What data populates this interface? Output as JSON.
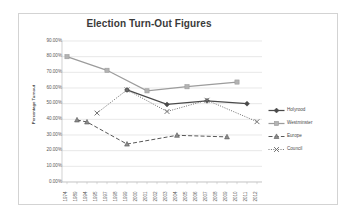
{
  "chart": {
    "title": "Election Turn-Out Figures",
    "y_axis_title": "Percentage Turnout",
    "legend_position": "right"
  },
  "chart_data": {
    "type": "line",
    "title": "Election Turn-Out Figures",
    "xlabel": "",
    "ylabel": "Percentage Turnout",
    "ylim": [
      0,
      90
    ],
    "ytick_labels": [
      "90.00%",
      "80.00%",
      "70.00%",
      "60.00%",
      "50.00%",
      "40.00%",
      "30.00%",
      "20.00%",
      "10.00%",
      "0.00%"
    ],
    "ytick_values": [
      90,
      80,
      70,
      60,
      50,
      40,
      30,
      20,
      10,
      0
    ],
    "grid": true,
    "categories": [
      "1974",
      "1989",
      "1994",
      "1995",
      "1997",
      "1998",
      "1999",
      "2000",
      "2001",
      "2002",
      "2003",
      "2004",
      "2005",
      "2006",
      "2007",
      "2008",
      "2009",
      "2010",
      "2011",
      "2012"
    ],
    "series": [
      {
        "name": "Holyrood",
        "marker": "diamond",
        "line_style": "solid",
        "color": "#4a4a4a",
        "points": [
          {
            "x": "1999",
            "y": 58.8
          },
          {
            "x": "2003",
            "y": 49.5
          },
          {
            "x": "2007",
            "y": 51.8
          },
          {
            "x": "2011",
            "y": 50.0
          }
        ]
      },
      {
        "name": "Westminster",
        "marker": "square",
        "line_style": "solid",
        "color": "#9c9c9c",
        "points": [
          {
            "x": "1974",
            "y": 80.0
          },
          {
            "x": "1997",
            "y": 71.3
          },
          {
            "x": "2001",
            "y": 58.2
          },
          {
            "x": "2005",
            "y": 60.8
          },
          {
            "x": "2010",
            "y": 63.8
          }
        ]
      },
      {
        "name": "Europe",
        "marker": "triangle",
        "line_style": "dashed",
        "color": "#585858",
        "points": [
          {
            "x": "1989",
            "y": 39.6
          },
          {
            "x": "1994",
            "y": 38.3
          },
          {
            "x": "1999",
            "y": 24.2
          },
          {
            "x": "2004",
            "y": 29.8
          },
          {
            "x": "2009",
            "y": 28.8
          }
        ]
      },
      {
        "name": "Council",
        "marker": "cross",
        "line_style": "dotted",
        "color": "#707070",
        "points": [
          {
            "x": "1995",
            "y": 44.0
          },
          {
            "x": "1999",
            "y": 58.8
          },
          {
            "x": "2003",
            "y": 45.0
          },
          {
            "x": "2007",
            "y": 52.2
          },
          {
            "x": "2012",
            "y": 38.5
          }
        ]
      }
    ]
  },
  "legend": {
    "items": [
      {
        "label": "Holyrood"
      },
      {
        "label": "Westminster"
      },
      {
        "label": "Europe"
      },
      {
        "label": "Council"
      }
    ]
  }
}
